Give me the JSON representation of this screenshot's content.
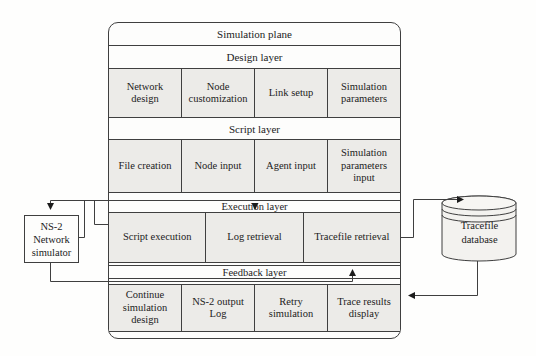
{
  "colors": {
    "line": "#3f3f3f",
    "cell_fill": "#ecebe8",
    "background": "#ffffff"
  },
  "plane": {
    "title": "Simulation plane",
    "layers": [
      {
        "name": "Design layer",
        "cells": [
          "Network design",
          "Node customization",
          "Link setup",
          "Simulation parameters"
        ]
      },
      {
        "name": "Script layer",
        "cells": [
          "File creation",
          "Node input",
          "Agent input",
          "Simulation parameters input"
        ]
      },
      {
        "name": "Execution layer",
        "cells": [
          "Script execution",
          "Log retrieval",
          "Tracefile retrieval"
        ]
      },
      {
        "name": "Feedback layer",
        "cells": [
          "Continue simulation design",
          "NS-2 output Log",
          "Retry simulation",
          "Trace results display"
        ]
      }
    ]
  },
  "external": {
    "simulator_label": "NS-2 Network simulator",
    "database_label": "Tracefile database"
  }
}
